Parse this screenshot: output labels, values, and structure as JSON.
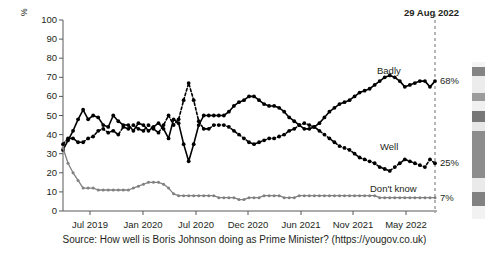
{
  "chart_data": {
    "type": "line",
    "title": "",
    "subtitle": "",
    "xlabel": "",
    "ylabel": "%",
    "ylim": [
      0,
      100
    ],
    "ytick_values": [
      0,
      10,
      20,
      30,
      40,
      50,
      60,
      70,
      80,
      90,
      100
    ],
    "ytick_labels": [
      "0",
      "10",
      "20",
      "30",
      "40",
      "50",
      "60",
      "70",
      "80",
      "90",
      "100"
    ],
    "xtick_labels": [
      "Jul 2019",
      "Jan 2020",
      "Jul 2020",
      "Dec 2020",
      "Jun 2021",
      "Nov 2021",
      "May 2022"
    ],
    "xtick_positions": [
      90,
      143,
      196,
      248,
      301,
      353,
      406
    ],
    "xlim": [
      63,
      435
    ],
    "grid": false,
    "legend_position": "inline-right",
    "series": [
      {
        "name": "Badly",
        "color": "#000000",
        "style": "solid",
        "marker": "circle",
        "end_value_label": "68%",
        "values": [
          32,
          37,
          42,
          48,
          53,
          48,
          50,
          49,
          45,
          44,
          50,
          47,
          45,
          45,
          42,
          46,
          45,
          42,
          44,
          46,
          43,
          38,
          48,
          46,
          35,
          26,
          35,
          45,
          50,
          50,
          50,
          50,
          50,
          52,
          55,
          57,
          58,
          60,
          60,
          58,
          56,
          55,
          55,
          54,
          52,
          49,
          47,
          45,
          43,
          43,
          44,
          46,
          49,
          52,
          54,
          56,
          57,
          58,
          60,
          62,
          63,
          64,
          66,
          68,
          70,
          71,
          70,
          68,
          65,
          66,
          67,
          68,
          68,
          65,
          68
        ]
      },
      {
        "name": "Well",
        "color": "#000000",
        "style": "dotted",
        "marker": "circle",
        "end_value_label": "25%",
        "values": [
          35,
          38,
          38,
          36,
          36,
          38,
          39,
          42,
          43,
          41,
          42,
          40,
          44,
          43,
          45,
          43,
          42,
          45,
          43,
          41,
          45,
          50,
          45,
          48,
          58,
          67,
          58,
          47,
          43,
          43,
          45,
          45,
          45,
          44,
          42,
          40,
          38,
          36,
          35,
          36,
          37,
          38,
          38,
          39,
          40,
          42,
          43,
          45,
          46,
          45,
          44,
          42,
          40,
          38,
          36,
          34,
          33,
          32,
          30,
          28,
          27,
          26,
          25,
          23,
          22,
          21,
          23,
          25,
          27,
          26,
          25,
          24,
          23,
          27,
          25
        ]
      },
      {
        "name": "Don't know",
        "color": "#808080",
        "style": "solid",
        "marker": "circle",
        "end_value_label": "7%",
        "values": [
          33,
          25,
          20,
          16,
          12,
          12,
          12,
          11,
          11,
          11,
          11,
          11,
          11,
          11,
          12,
          13,
          14,
          15,
          15,
          15,
          14,
          12,
          9,
          8,
          8,
          8,
          8,
          8,
          8,
          8,
          8,
          7,
          7,
          7,
          7,
          6,
          6,
          7,
          7,
          7,
          8,
          8,
          8,
          8,
          7,
          7,
          7,
          8,
          8,
          8,
          8,
          8,
          8,
          8,
          8,
          8,
          8,
          8,
          8,
          8,
          8,
          8,
          8,
          7,
          7,
          7,
          7,
          7,
          7,
          7,
          7,
          7,
          7,
          7,
          7
        ]
      }
    ],
    "annotations": [
      {
        "name": "event-marker",
        "text": "29 Aug 2022",
        "type": "vertical-dashed-line",
        "x": 435
      }
    ]
  },
  "labels": {
    "y_axis_title": "%",
    "badly": "Badly",
    "well": "Well",
    "dont_know": "Don't know",
    "badly_value": "68%",
    "well_value": "25%",
    "dont_know_value": "7%",
    "event_date": "29 Aug 2022"
  },
  "source": {
    "caption": "Source: How well is Boris Johnson doing as Prime Minister? (https://yougov.co.uk)"
  },
  "colors": {
    "badly": "#000000",
    "well": "#000000",
    "dont_know": "#808080",
    "axis": "#58595b",
    "text": "#231f20",
    "background": "#ffffff"
  }
}
